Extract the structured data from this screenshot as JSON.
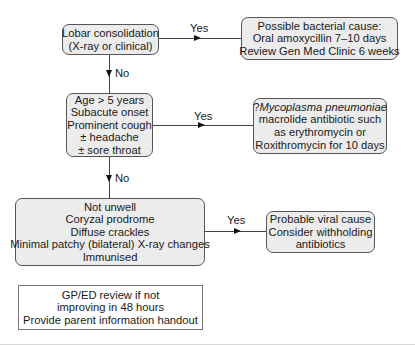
{
  "diagram": {
    "type": "flowchart",
    "nodes": {
      "lobar": {
        "lines": [
          "Lobar consolidation",
          "(X-ray or clinical)"
        ]
      },
      "bacterial": {
        "lines": [
          "Possible bacterial cause:",
          "Oral amoxycillin 7–10 days",
          "Review Gen Med Clinic 6 weeks"
        ]
      },
      "age": {
        "lines": [
          "Age > 5 years",
          "Subacute onset",
          "Prominent cough",
          "± headache",
          "± sore throat"
        ]
      },
      "mycoplasma": {
        "prefix": "?",
        "italic": "Mycoplasma pneumoniae",
        "lines": [
          "macrolide antibiotic such",
          "as erythromycin or",
          "Roxithromycin for 10 days"
        ]
      },
      "viral_criteria": {
        "lines": [
          "Not unwell",
          "Coryzal prodrome",
          "Diffuse crackles",
          "Minimal patchy (bilateral) X-ray changes",
          "Immunised"
        ]
      },
      "viral": {
        "lines": [
          "Probable viral cause",
          "Consider withholding",
          "antibiotics"
        ]
      },
      "review": {
        "lines": [
          "GP/ED review if not",
          "improving in 48 hours",
          "Provide parent information handout"
        ]
      }
    },
    "edges": {
      "lobar_yes": "Yes",
      "lobar_no": "No",
      "age_yes": "Yes",
      "age_no": "No",
      "viral_yes": "Yes"
    }
  }
}
